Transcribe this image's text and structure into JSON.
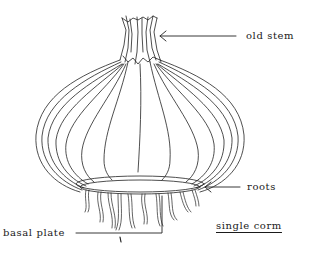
{
  "diagram": {
    "subject": "corm",
    "title": "single corm",
    "labels": [
      {
        "id": "old-stem",
        "text": "old stem"
      },
      {
        "id": "roots",
        "text": "roots"
      },
      {
        "id": "basal-plate",
        "text": "basal plate"
      }
    ]
  }
}
